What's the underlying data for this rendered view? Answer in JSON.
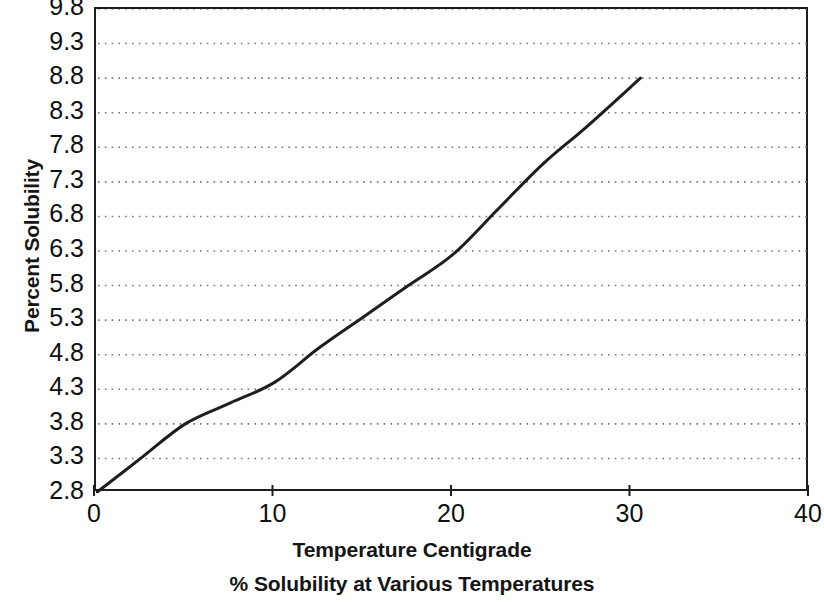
{
  "chart_data": {
    "type": "line",
    "title": "% Solubility at Various Temperatures",
    "xlabel": "Temperature Centigrade",
    "ylabel": "Percent Solubility",
    "xlim": [
      0,
      40
    ],
    "ylim": [
      2.8,
      9.8
    ],
    "grid": true,
    "grid_style": "dotted-horizontal",
    "legend": null,
    "xticks": [
      0,
      10,
      20,
      30,
      40
    ],
    "xtick_labels": [
      "0",
      "10",
      "20",
      "30",
      "40"
    ],
    "yticks": [
      2.8,
      3.3,
      3.8,
      4.3,
      4.8,
      5.3,
      5.8,
      6.3,
      6.8,
      7.3,
      7.8,
      8.3,
      8.8,
      9.3,
      9.8
    ],
    "ytick_labels": [
      "2.8",
      "3.3",
      "3.8",
      "4.3",
      "4.8",
      "5.3",
      "5.8",
      "6.3",
      "6.8",
      "7.3",
      "7.8",
      "8.3",
      "8.8",
      "9.3",
      "9.8"
    ],
    "series": [
      {
        "name": "Percent Solubility",
        "color": "#1e1e1e",
        "line_width": 3,
        "x": [
          0,
          2.5,
          5,
          7.5,
          10,
          12.5,
          15,
          17.5,
          20,
          22.5,
          25,
          27.5,
          30.5
        ],
        "values": [
          2.8,
          3.3,
          3.8,
          4.1,
          4.4,
          4.9,
          5.35,
          5.8,
          6.25,
          6.9,
          7.55,
          8.1,
          8.8
        ]
      }
    ],
    "annotations": []
  }
}
